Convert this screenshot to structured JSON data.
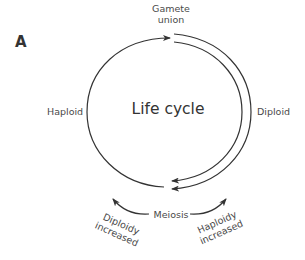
{
  "figure": {
    "panel_letter": "A",
    "center_title": "Life cycle",
    "labels": {
      "top": [
        "Gamete",
        "union"
      ],
      "left": "Haploid",
      "right": "Diploid",
      "bottom": "Meiosis",
      "bottom_left": [
        "Diploidy",
        "increased"
      ],
      "bottom_right": [
        "Haploidy",
        "increased"
      ]
    },
    "arrows": [
      {
        "name": "haploid-phase-arrow",
        "from": "Meiosis",
        "to": "Gamete union",
        "side": "left"
      },
      {
        "name": "diploid-phase-arrow-outer",
        "from": "Gamete union",
        "to": "Meiosis",
        "side": "right"
      },
      {
        "name": "diploid-phase-arrow-inner",
        "from": "Gamete union",
        "to": "Meiosis",
        "side": "right"
      },
      {
        "name": "diploidy-increased-arrow",
        "from": "Meiosis",
        "to": "Diploidy increased"
      },
      {
        "name": "haploidy-increased-arrow",
        "from": "Meiosis",
        "to": "Haploidy increased"
      }
    ],
    "colors": {
      "stroke": "#333333",
      "text": "#4a4a4a",
      "background": "#ffffff"
    }
  }
}
